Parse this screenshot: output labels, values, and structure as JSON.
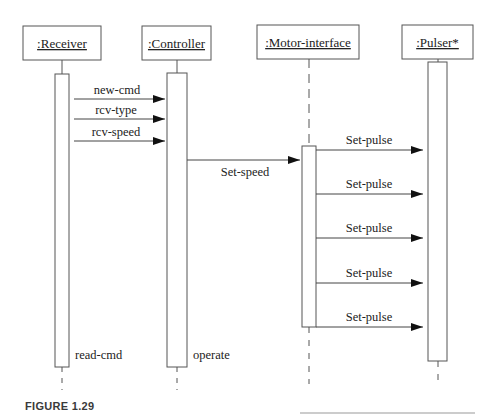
{
  "figure": {
    "caption": "FIGURE 1.29"
  },
  "objects": [
    {
      "id": "receiver",
      "label": ":Receiver",
      "box": {
        "x": 23,
        "y": 26,
        "w": 78,
        "h": 34
      },
      "lifeline_x": 62,
      "activation": {
        "x": 55,
        "y": 74,
        "w": 14,
        "h": 293
      },
      "activation_label": "read-cmd"
    },
    {
      "id": "controller",
      "label": ":Controller",
      "box": {
        "x": 142,
        "y": 26,
        "w": 69,
        "h": 34
      },
      "lifeline_x": 177,
      "activation": {
        "x": 167,
        "y": 73,
        "w": 20,
        "h": 294
      },
      "activation_label": "operate"
    },
    {
      "id": "motor-interface",
      "label": ":Motor-interface",
      "box": {
        "x": 257,
        "y": 25,
        "w": 102,
        "h": 34
      },
      "lifeline_x": 309,
      "activation": {
        "x": 302,
        "y": 146,
        "w": 14,
        "h": 181
      },
      "activation_label": ""
    },
    {
      "id": "pulser",
      "label": ":Pulser*",
      "box": {
        "x": 402,
        "y": 25,
        "w": 71,
        "h": 34
      },
      "lifeline_x": 438,
      "activation": {
        "x": 428,
        "y": 62,
        "w": 19,
        "h": 299
      },
      "activation_label": ""
    }
  ],
  "messages": [
    {
      "label": "new-cmd",
      "from": "receiver",
      "to": "controller",
      "y": 99
    },
    {
      "label": "rcv-type",
      "from": "receiver",
      "to": "controller",
      "y": 119
    },
    {
      "label": "rcv-speed",
      "from": "receiver",
      "to": "controller",
      "y": 141
    },
    {
      "label": "Set-speed",
      "from": "controller",
      "to": "motor-interface",
      "y": 160,
      "label_below": true
    },
    {
      "label": "Set-pulse",
      "from": "motor-interface",
      "to": "pulser",
      "y": 150
    },
    {
      "label": "Set-pulse",
      "from": "motor-interface",
      "to": "pulser",
      "y": 194
    },
    {
      "label": "Set-pulse",
      "from": "motor-interface",
      "to": "pulser",
      "y": 238
    },
    {
      "label": "Set-pulse",
      "from": "motor-interface",
      "to": "pulser",
      "y": 283
    },
    {
      "label": "Set-pulse",
      "from": "motor-interface",
      "to": "pulser",
      "y": 327
    }
  ],
  "colors": {
    "line": "#555555",
    "text": "#222222",
    "caption": "#3a3a3a"
  }
}
